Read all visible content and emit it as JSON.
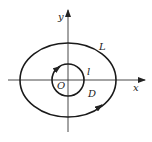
{
  "figure": {
    "type": "coordinate diagram",
    "labels": {
      "y_axis": "y",
      "x_axis": "x",
      "origin": "O",
      "outer_curve": "L",
      "inner_curve": "l",
      "region": "D"
    },
    "orientation": {
      "outer_curve": "counterclockwise",
      "inner_curve": "clockwise"
    },
    "colors": {
      "stroke": "#1a1a1a",
      "background": "#ffffff"
    }
  }
}
